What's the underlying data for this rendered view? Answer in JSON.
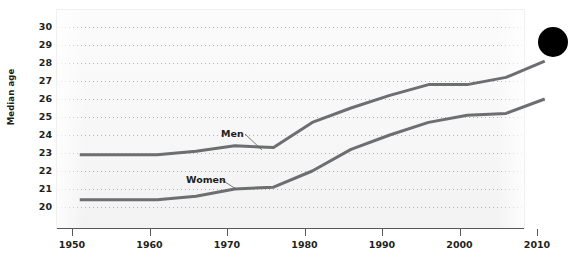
{
  "figure": {
    "bullet_marker": "page-bullet-dot",
    "accent_color": "#6d6e71",
    "text_color": "#231f20",
    "grid_color": "#9b9b9b",
    "panel_color": "#f7f7f7"
  },
  "chart_data": {
    "type": "line",
    "title": "",
    "subtitle": "",
    "xlabel": "",
    "ylabel": "Median age",
    "xlim": [
      1948,
      2013
    ],
    "ylim": [
      19.3,
      30.4
    ],
    "xticks": [
      1950,
      1960,
      1970,
      1980,
      1990,
      2000,
      2010
    ],
    "xtick_labels": [
      "1950",
      "1960",
      "1970",
      "1980",
      "1990",
      "2000",
      "2010"
    ],
    "yticks": [
      20,
      21,
      22,
      23,
      24,
      25,
      26,
      27,
      28,
      29,
      30
    ],
    "ytick_labels": [
      "20",
      "21",
      "22",
      "23",
      "24",
      "25",
      "26",
      "27",
      "28",
      "29",
      "30"
    ],
    "grid": "horizontal-dotted",
    "legend": "inline-annotations",
    "annotations": [
      {
        "text": "Men",
        "x": 1971,
        "y": 24.2
      },
      {
        "text": "Women",
        "x": 1966,
        "y": 21.7
      }
    ],
    "series": [
      {
        "name": "Men",
        "color": "#6d6e71",
        "x": [
          1951,
          1956,
          1961,
          1966,
          1971,
          1976,
          1981,
          1986,
          1991,
          1996,
          2001,
          2006,
          2011
        ],
        "values": [
          22.9,
          22.9,
          22.9,
          23.1,
          23.4,
          23.3,
          24.7,
          25.5,
          26.2,
          26.8,
          26.8,
          27.2,
          28.1
        ]
      },
      {
        "name": "Women",
        "color": "#6d6e71",
        "x": [
          1951,
          1956,
          1961,
          1966,
          1971,
          1976,
          1981,
          1986,
          1991,
          1996,
          2001,
          2006,
          2011
        ],
        "values": [
          20.4,
          20.4,
          20.4,
          20.6,
          21.0,
          21.1,
          22.0,
          23.2,
          24.0,
          24.7,
          25.1,
          25.2,
          26.0
        ]
      }
    ]
  }
}
